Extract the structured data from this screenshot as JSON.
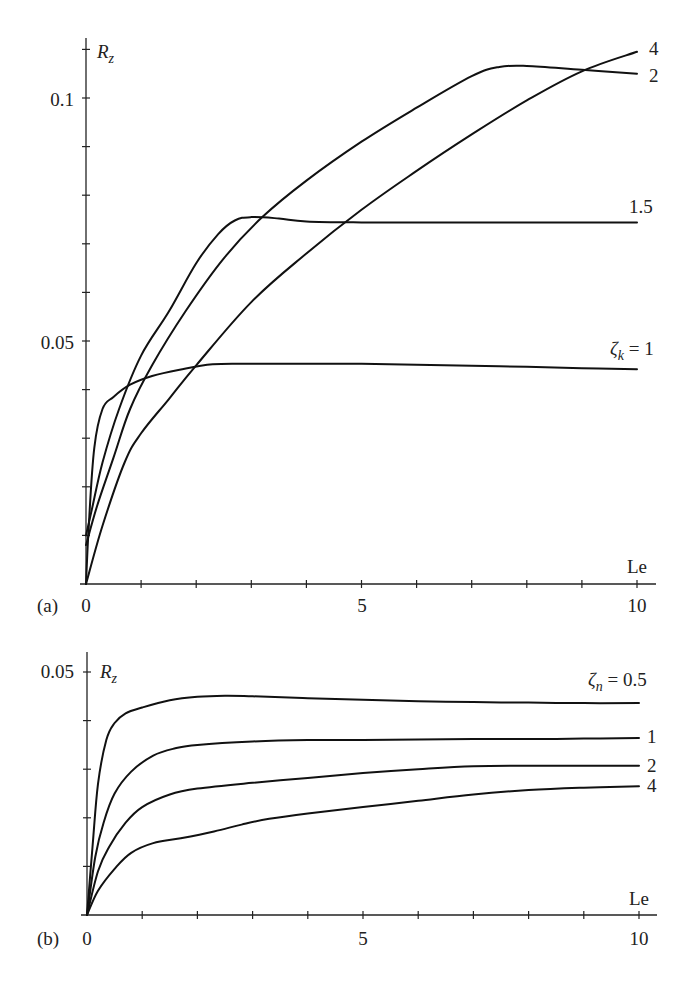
{
  "chart_data": [
    {
      "panel": "(a)",
      "type": "line",
      "xlabel": "Le",
      "ylabel": "R_z",
      "xlim": [
        0,
        10
      ],
      "ylim": [
        0,
        0.11
      ],
      "x_ticks": [
        0,
        5,
        10
      ],
      "x_minor_step": 1,
      "y_ticks": [
        0.05,
        0.1
      ],
      "y_minor_step": 0.01,
      "grid": false,
      "legend_position": "inline-right",
      "parameter": "ζ_k",
      "series": [
        {
          "name": "ζk = 1",
          "label": "ζ_k = 1",
          "x": [
            0,
            0.05,
            0.15,
            0.3,
            0.5,
            0.8,
            1.2,
            1.7,
            2.3,
            3,
            4,
            5,
            6,
            7,
            8,
            9,
            10
          ],
          "y": [
            0,
            0.012,
            0.028,
            0.036,
            0.0385,
            0.041,
            0.0428,
            0.0441,
            0.0452,
            0.0453,
            0.0453,
            0.0453,
            0.0451,
            0.0449,
            0.0447,
            0.0444,
            0.0442
          ]
        },
        {
          "name": "ζk = 1.5",
          "label": "1.5",
          "x": [
            0,
            0.1,
            0.3,
            0.6,
            1.0,
            1.5,
            2.0,
            2.4,
            2.7,
            3.0,
            3.5,
            4,
            5,
            6,
            7,
            8,
            9,
            10
          ],
          "y": [
            0.01,
            0.015,
            0.025,
            0.036,
            0.047,
            0.056,
            0.066,
            0.072,
            0.0748,
            0.0755,
            0.0752,
            0.0746,
            0.0744,
            0.0744,
            0.0744,
            0.0744,
            0.0744,
            0.0744
          ]
        },
        {
          "name": "ζk = 2",
          "label": "2",
          "x": [
            0,
            0.2,
            0.5,
            0.8,
            1.2,
            1.8,
            2.5,
            3.2,
            4,
            5,
            6,
            7,
            7.5,
            8,
            9,
            10
          ],
          "y": [
            0.008,
            0.016,
            0.026,
            0.036,
            0.045,
            0.056,
            0.067,
            0.0755,
            0.083,
            0.091,
            0.098,
            0.1045,
            0.1064,
            0.1066,
            0.1058,
            0.105
          ]
        },
        {
          "name": "ζk = 4",
          "label": "4",
          "x": [
            0,
            0.3,
            0.7,
            1.0,
            1.5,
            2.0,
            3,
            4,
            5,
            6,
            7,
            8,
            9,
            10
          ],
          "y": [
            0,
            0.012,
            0.025,
            0.031,
            0.038,
            0.045,
            0.058,
            0.068,
            0.077,
            0.085,
            0.0925,
            0.0995,
            0.1055,
            0.1095
          ]
        }
      ]
    },
    {
      "panel": "(b)",
      "type": "line",
      "xlabel": "Le",
      "ylabel": "R_z",
      "xlim": [
        0,
        10
      ],
      "ylim": [
        0,
        0.05
      ],
      "x_ticks": [
        0,
        5,
        10
      ],
      "x_minor_step": 1,
      "y_ticks": [
        0.05
      ],
      "y_minor_step": 0.01,
      "grid": false,
      "legend_position": "inline-right",
      "parameter": "ζ_n",
      "series": [
        {
          "name": "ζn = 0.5",
          "label": "ζ_n = 0.5",
          "x": [
            0,
            0.1,
            0.2,
            0.35,
            0.5,
            0.7,
            1.0,
            1.5,
            2.0,
            2.5,
            3,
            4,
            5,
            6,
            7,
            8,
            9,
            10
          ],
          "y": [
            0,
            0.014,
            0.027,
            0.036,
            0.0395,
            0.0415,
            0.0427,
            0.0442,
            0.0449,
            0.0451,
            0.045,
            0.0446,
            0.0443,
            0.044,
            0.0438,
            0.0437,
            0.0436,
            0.0436
          ]
        },
        {
          "name": "ζn = 1",
          "label": "1",
          "x": [
            0,
            0.15,
            0.3,
            0.5,
            0.8,
            1.2,
            1.6,
            2,
            3,
            4,
            5,
            6,
            7,
            8,
            9,
            10
          ],
          "y": [
            0,
            0.012,
            0.019,
            0.025,
            0.0295,
            0.0328,
            0.0343,
            0.035,
            0.0357,
            0.036,
            0.036,
            0.0361,
            0.0362,
            0.0362,
            0.0363,
            0.0364
          ]
        },
        {
          "name": "ζn = 2",
          "label": "2",
          "x": [
            0,
            0.2,
            0.4,
            0.7,
            1.0,
            1.5,
            2,
            3,
            4,
            5,
            6,
            7,
            8,
            9,
            10
          ],
          "y": [
            0,
            0.009,
            0.014,
            0.019,
            0.0222,
            0.0248,
            0.026,
            0.0272,
            0.0282,
            0.0292,
            0.03,
            0.0306,
            0.0307,
            0.0307,
            0.0307
          ]
        },
        {
          "name": "ζn = 4",
          "label": "4",
          "x": [
            0,
            0.2,
            0.5,
            0.8,
            1.2,
            1.7,
            2.3,
            2.8,
            3.3,
            4,
            5,
            6,
            7,
            8,
            9,
            10
          ],
          "y": [
            0,
            0.005,
            0.0095,
            0.0128,
            0.0148,
            0.0158,
            0.0172,
            0.0186,
            0.0198,
            0.0209,
            0.0222,
            0.0235,
            0.0248,
            0.0257,
            0.0262,
            0.0265
          ]
        }
      ]
    }
  ],
  "labels": {
    "panel_a": "(a)",
    "panel_b": "(b)",
    "a_ylabel_main": "R",
    "a_ylabel_sub": "z",
    "b_ylabel_main": "R",
    "b_ylabel_sub": "z",
    "a_xlabel": "Le",
    "b_xlabel": "Le",
    "a_y_0_1": "0.1",
    "a_y_0_05": "0.05",
    "b_y_0_05": "0.05",
    "a_x0": "0",
    "a_x5": "5",
    "a_x10": "10",
    "b_x0": "0",
    "b_x5": "5",
    "b_x10": "10",
    "a_legend_zeta": "ζ",
    "a_legend_sub": "k",
    "a_legend_val": " = 1",
    "a_legend_15": "1.5",
    "a_legend_2": "2",
    "a_legend_4": "4",
    "b_legend_zeta": "ζ",
    "b_legend_sub": "n",
    "b_legend_val": " = 0.5",
    "b_legend_1": "1",
    "b_legend_2": "2",
    "b_legend_4": "4"
  }
}
